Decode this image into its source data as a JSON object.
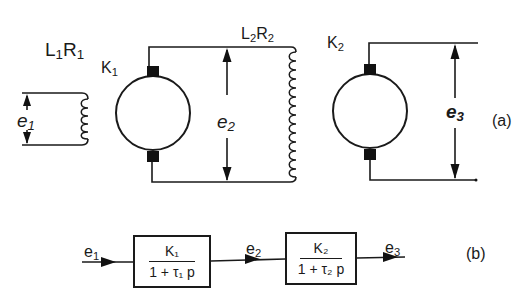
{
  "figure": {
    "part_a": {
      "label": "(a)",
      "field_winding_1": {
        "label_L": "L",
        "label_L_sub": "1",
        "label_R": "R",
        "label_R_sub": "1"
      },
      "input_voltage": {
        "label": "e",
        "sub": "1"
      },
      "generator_1": {
        "label": "K",
        "sub": "1"
      },
      "intermediate_voltage": {
        "label": "e",
        "sub": "2"
      },
      "field_winding_2": {
        "label_L": "L",
        "label_L_sub": "2",
        "label_R": "R",
        "label_R_sub": "2"
      },
      "generator_2": {
        "label": "K",
        "sub": "2"
      },
      "output_voltage": {
        "label": "e",
        "sub": "3"
      }
    },
    "part_b": {
      "label": "(b)",
      "input": {
        "label": "e",
        "sub": "1"
      },
      "block_1": {
        "numerator": "K₁",
        "denominator": "1 + τ₁ p"
      },
      "middle": {
        "label": "e",
        "sub": "2"
      },
      "block_2": {
        "numerator": "K₂",
        "denominator": "1 + τ₂ p"
      },
      "output": {
        "label": "e",
        "sub": "3"
      }
    }
  }
}
